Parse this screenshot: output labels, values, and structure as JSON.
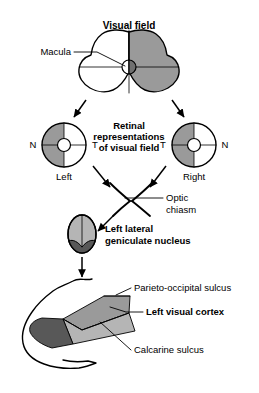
{
  "figure": {
    "background_color": "#ffffff",
    "width": 259,
    "height": 393
  },
  "colors": {
    "outline": "#000000",
    "text": "#000000",
    "shade_mid_gray": "#9a9a9a",
    "shade_light_gray": "#b5b5b5",
    "shade_dark_gray": "#585858",
    "shade_pale_gray": "#c9c9c9",
    "white": "#ffffff"
  },
  "sections": {
    "visual_field": {
      "title": "Visual field",
      "macula_label": "Macula",
      "shaded_half": "right"
    },
    "retina": {
      "caption_line1": "Retinal",
      "caption_line2": "representations",
      "caption_line3": "of visual field",
      "left_eye": {
        "name": "Left",
        "nasal_label": "N",
        "temporal_label": "T",
        "nasal_side": "left",
        "temporal_side": "right",
        "shaded_half": "left"
      },
      "right_eye": {
        "name": "Right",
        "temporal_label": "T",
        "nasal_label": "N",
        "temporal_side": "left",
        "nasal_side": "right",
        "shaded_half": "left"
      }
    },
    "chiasm": {
      "label_line1": "Optic",
      "label_line2": "chiasm"
    },
    "lgn": {
      "label_line1": "Left lateral",
      "label_line2": "geniculate nucleus"
    },
    "cortex": {
      "title": "Left visual cortex",
      "parieto_occipital_sulcus": "Parieto-occipital sulcus",
      "calcarine_sulcus": "Calcarine sulcus"
    }
  }
}
